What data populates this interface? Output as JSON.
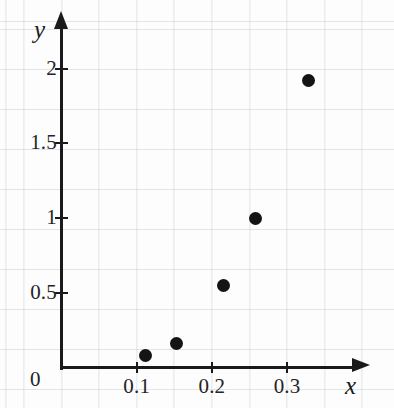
{
  "chart_data": {
    "type": "scatter",
    "title": "",
    "subtitle": "",
    "xlabel": "x",
    "ylabel": "y",
    "origin_label": "0",
    "xlim": [
      0,
      0.355
    ],
    "ylim": [
      0,
      2.28
    ],
    "grid": true,
    "grid_style": "graph-paper",
    "legend": null,
    "legend_position": "none",
    "marker": "filled-circle",
    "marker_color": "#141414",
    "axis_color": "#1a1a1a",
    "grid_color": "#96a0af",
    "background_color": "#fdfdfc",
    "x_ticks": [
      {
        "value": 0.1,
        "label": "0.1"
      },
      {
        "value": 0.2,
        "label": "0.2"
      },
      {
        "value": 0.3,
        "label": "0.3"
      }
    ],
    "y_ticks": [
      {
        "value": 0.5,
        "label": "0.5"
      },
      {
        "value": 1.0,
        "label": "1"
      },
      {
        "value": 1.5,
        "label": "1.5"
      },
      {
        "value": 2.0,
        "label": "2"
      }
    ],
    "x": [
      0.112,
      0.153,
      0.215,
      0.258,
      0.328
    ],
    "y": [
      0.08,
      0.16,
      0.55,
      1.0,
      1.92
    ],
    "points": [
      {
        "x": 0.112,
        "y": 0.08
      },
      {
        "x": 0.153,
        "y": 0.16
      },
      {
        "x": 0.215,
        "y": 0.55
      },
      {
        "x": 0.258,
        "y": 1.0
      },
      {
        "x": 0.328,
        "y": 1.92
      }
    ],
    "annotations": []
  }
}
